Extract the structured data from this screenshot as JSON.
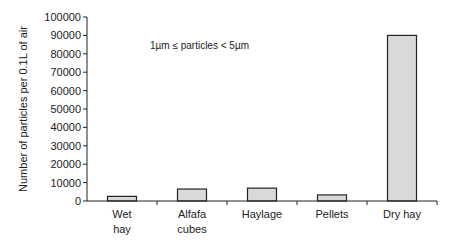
{
  "chart_data": {
    "type": "bar",
    "title": "",
    "annotation": "1µm ≤ particles < 5µm",
    "xlabel": "",
    "ylabel": "Number of particles per 0.1L of air",
    "categories": [
      [
        "Wet",
        "hay"
      ],
      [
        "Alfafa",
        "cubes"
      ],
      [
        "Haylage"
      ],
      [
        "Pellets"
      ],
      [
        "Dry hay"
      ]
    ],
    "category_names": [
      "Wet hay",
      "Alfafa cubes",
      "Haylage",
      "Pellets",
      "Dry hay"
    ],
    "values": [
      2500,
      6500,
      7000,
      3300,
      90000
    ],
    "ylim": [
      0,
      100000
    ],
    "yticks": [
      0,
      10000,
      20000,
      30000,
      40000,
      50000,
      60000,
      70000,
      80000,
      90000,
      100000
    ],
    "grid": false,
    "legend": "none",
    "bar_color": "#d9d9d9",
    "bar_edge": "#222222"
  }
}
